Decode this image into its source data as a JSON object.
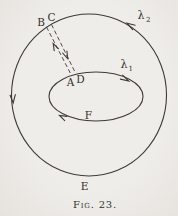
{
  "figure": {
    "caption": "Fig. 23.",
    "labels": {
      "B": "B",
      "C": "C",
      "A": "A",
      "D": "D",
      "F": "F",
      "E": "E",
      "lambda1": {
        "base": "λ",
        "sub": "1"
      },
      "lambda2": {
        "base": "λ",
        "sub": "2"
      }
    },
    "colors": {
      "ink": "#3e3a35",
      "text_ink": "#34302b",
      "paper": "#efedea",
      "paper_edge": "#e6e3de"
    }
  }
}
